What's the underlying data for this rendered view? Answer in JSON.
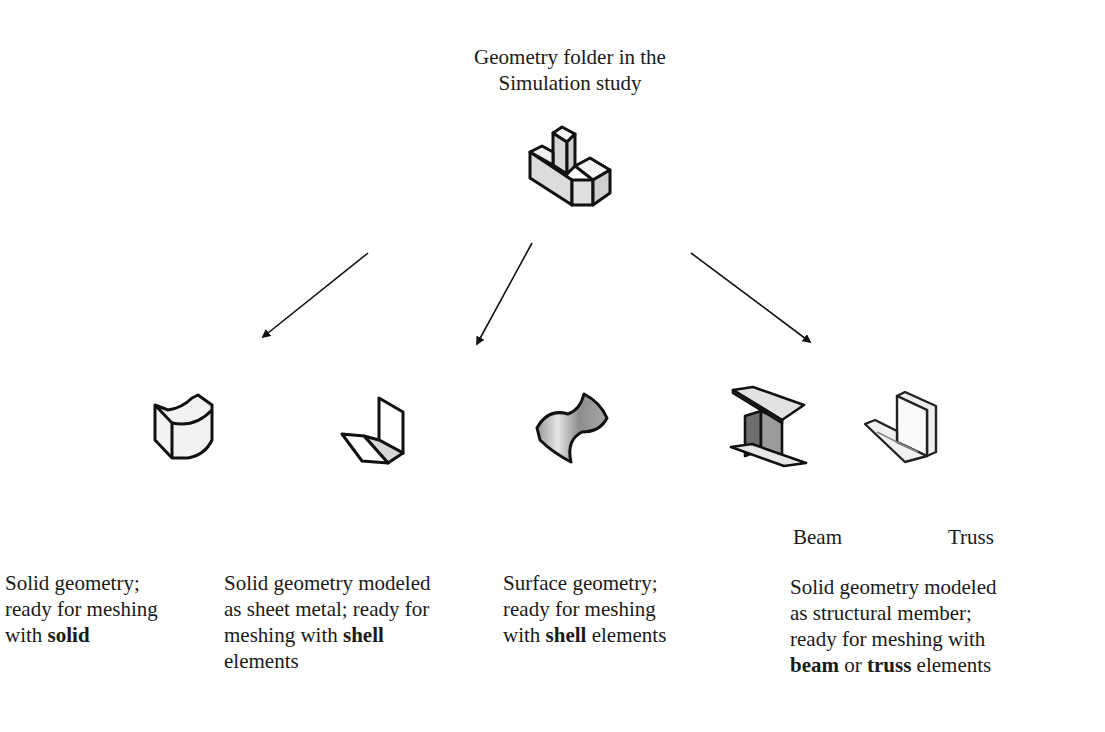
{
  "root": {
    "title_lines": [
      "Geometry folder in the",
      "Simulation study"
    ],
    "icon": "geometry-folder-part-icon"
  },
  "arrows": [
    {
      "from": [
        368,
        253
      ],
      "to": [
        263,
        337
      ]
    },
    {
      "from": [
        532,
        243
      ],
      "to": [
        477,
        344
      ]
    },
    {
      "from": [
        691,
        253
      ],
      "to": [
        810,
        342
      ]
    }
  ],
  "branches": [
    {
      "id": "solid",
      "icon": "solid-body-icon",
      "caption": {
        "lines": [
          [
            {
              "t": "Solid geometry;"
            }
          ],
          [
            {
              "t": "ready for meshing"
            }
          ],
          [
            {
              "t": "with "
            },
            {
              "t": "solid",
              "b": true
            }
          ]
        ]
      }
    },
    {
      "id": "sheet-metal",
      "icon": "sheet-metal-icon",
      "caption": {
        "lines": [
          [
            {
              "t": "Solid geometry modeled"
            }
          ],
          [
            {
              "t": "as sheet metal; ready for"
            }
          ],
          [
            {
              "t": "meshing with "
            },
            {
              "t": "shell",
              "b": true
            }
          ],
          [
            {
              "t": "elements"
            }
          ]
        ]
      }
    },
    {
      "id": "surface",
      "icon": "surface-body-icon",
      "caption": {
        "lines": [
          [
            {
              "t": "Surface geometry;"
            }
          ],
          [
            {
              "t": "ready for meshing"
            }
          ],
          [
            {
              "t": "with "
            },
            {
              "t": "shell",
              "b": true
            },
            {
              "t": " elements"
            }
          ]
        ]
      }
    },
    {
      "id": "structural-member",
      "icons": [
        "beam-icon",
        "truss-icon"
      ],
      "sublabels": {
        "beam": "Beam",
        "truss": "Truss"
      },
      "caption": {
        "lines": [
          [
            {
              "t": "Solid geometry modeled"
            }
          ],
          [
            {
              "t": "as structural member;"
            }
          ],
          [
            {
              "t": "ready for meshing with"
            }
          ],
          [
            {
              "t": "beam",
              "b": true
            },
            {
              "t": " or "
            },
            {
              "t": "truss",
              "b": true
            },
            {
              "t": " elements"
            }
          ]
        ]
      }
    }
  ],
  "colors": {
    "ink": "#1a1a1a",
    "fill_light": "#ececec",
    "fill_mid": "#bdbdbd",
    "fill_dark": "#8a8a8a"
  }
}
